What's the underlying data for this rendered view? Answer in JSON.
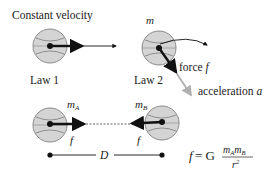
{
  "law1": {
    "title": "Constant velocity",
    "label": "Law 1"
  },
  "law2": {
    "mass_label": "m",
    "force_label": "force ",
    "force_symbol": "f",
    "accel_label": "acceleration ",
    "accel_symbol": "a",
    "label": "Law 2"
  },
  "law3": {
    "mass_a": "m",
    "mass_a_sub": "A",
    "mass_b": "m",
    "mass_b_sub": "B",
    "force_a": "f",
    "force_b": "f",
    "distance": "D"
  },
  "formula": {
    "lhs": "f",
    "eq": " = G",
    "num1": "m",
    "num1_sub": "A",
    "num2": "m",
    "num2_sub": "B",
    "den": "r",
    "den_sup": "2"
  },
  "colors": {
    "ball_fill": "#d4d4d4",
    "ball_stroke": "#8a8a8a",
    "ink": "#111111",
    "accel_arrow": "#b0b0b0"
  }
}
